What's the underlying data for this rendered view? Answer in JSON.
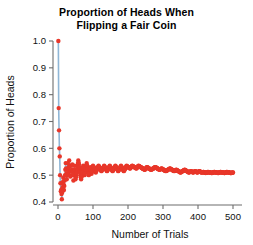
{
  "chart_data": {
    "type": "scatter",
    "title": "Proportion of Heads When\nFlipping a Fair Coin",
    "title_line1": "Proportion of Heads When",
    "title_line2": "Flipping a Fair Coin",
    "xlabel": "Number of Trials",
    "ylabel": "Proportion of Heads",
    "xlim": [
      -8,
      515
    ],
    "ylim": [
      0.38,
      1.03
    ],
    "xticks": [
      0,
      100,
      200,
      300,
      400,
      500
    ],
    "xticklabels": [
      "0",
      "100",
      "200",
      "300",
      "400",
      "500"
    ],
    "yticks": [
      0.4,
      0.5,
      0.6,
      0.7,
      0.8,
      0.9,
      1.0
    ],
    "yticklabels": [
      "0.4",
      "0.5",
      "0.6",
      "0.7",
      "0.8",
      "0.9",
      "1.0"
    ],
    "grid": false,
    "legend": null,
    "marker_color": "#e8372a",
    "line_color": "#8fb6d6",
    "axis_color": "#6d6d6d",
    "marker_size": 2.2,
    "series": [
      {
        "name": "Running proportion of heads",
        "x": [
          1,
          2,
          3,
          4,
          5,
          6,
          7,
          8,
          9,
          10,
          11,
          12,
          13,
          14,
          15,
          16,
          17,
          18,
          19,
          20,
          21,
          22,
          23,
          24,
          25,
          26,
          27,
          28,
          29,
          30,
          31,
          32,
          33,
          34,
          35,
          36,
          37,
          38,
          39,
          40,
          41,
          42,
          43,
          44,
          45,
          46,
          47,
          48,
          49,
          50,
          52,
          54,
          56,
          58,
          60,
          62,
          64,
          66,
          68,
          70,
          72,
          74,
          76,
          78,
          80,
          82,
          84,
          86,
          88,
          90,
          92,
          94,
          96,
          98,
          100,
          104,
          108,
          112,
          116,
          120,
          124,
          128,
          132,
          136,
          140,
          144,
          148,
          152,
          156,
          160,
          164,
          168,
          172,
          176,
          180,
          184,
          188,
          192,
          196,
          200,
          206,
          212,
          218,
          224,
          230,
          236,
          242,
          248,
          254,
          260,
          266,
          272,
          278,
          284,
          290,
          296,
          302,
          308,
          314,
          320,
          326,
          332,
          338,
          344,
          350,
          356,
          362,
          368,
          374,
          380,
          386,
          392,
          398,
          404,
          410,
          416,
          422,
          428,
          434,
          440,
          446,
          452,
          458,
          464,
          470,
          476,
          482,
          488,
          494,
          500
        ],
        "y": [
          1.0,
          0.75,
          0.667,
          0.6,
          0.57,
          0.5,
          0.47,
          0.44,
          0.445,
          0.43,
          0.41,
          0.435,
          0.455,
          0.475,
          0.49,
          0.465,
          0.445,
          0.46,
          0.48,
          0.5,
          0.52,
          0.545,
          0.525,
          0.505,
          0.485,
          0.5,
          0.52,
          0.545,
          0.525,
          0.505,
          0.53,
          0.555,
          0.535,
          0.515,
          0.495,
          0.515,
          0.535,
          0.515,
          0.5,
          0.52,
          0.54,
          0.52,
          0.5,
          0.48,
          0.5,
          0.515,
          0.535,
          0.52,
          0.5,
          0.485,
          0.5,
          0.515,
          0.535,
          0.555,
          0.54,
          0.52,
          0.5,
          0.485,
          0.5,
          0.52,
          0.535,
          0.515,
          0.5,
          0.515,
          0.53,
          0.545,
          0.53,
          0.515,
          0.5,
          0.515,
          0.53,
          0.52,
          0.505,
          0.52,
          0.535,
          0.525,
          0.51,
          0.525,
          0.535,
          0.525,
          0.515,
          0.525,
          0.535,
          0.525,
          0.515,
          0.525,
          0.535,
          0.525,
          0.515,
          0.525,
          0.535,
          0.525,
          0.515,
          0.525,
          0.535,
          0.525,
          0.515,
          0.525,
          0.535,
          0.53,
          0.525,
          0.535,
          0.53,
          0.525,
          0.535,
          0.53,
          0.525,
          0.52,
          0.53,
          0.525,
          0.52,
          0.525,
          0.53,
          0.525,
          0.52,
          0.525,
          0.52,
          0.515,
          0.52,
          0.525,
          0.52,
          0.515,
          0.52,
          0.515,
          0.51,
          0.515,
          0.52,
          0.515,
          0.51,
          0.515,
          0.51,
          0.515,
          0.51,
          0.515,
          0.51,
          0.512,
          0.508,
          0.512,
          0.51,
          0.508,
          0.512,
          0.51,
          0.508,
          0.512,
          0.51,
          0.508,
          0.512,
          0.51,
          0.508,
          0.51
        ]
      }
    ],
    "connector_line": {
      "note": "light blue polyline connecting the earliest points",
      "x": [
        1,
        2,
        3,
        4,
        5,
        6,
        7,
        8,
        9,
        10,
        11,
        12,
        13,
        14,
        15,
        16,
        17,
        18,
        19,
        20,
        22,
        25,
        28,
        32,
        36,
        40
      ],
      "y": [
        1.0,
        0.75,
        0.667,
        0.6,
        0.57,
        0.5,
        0.47,
        0.44,
        0.445,
        0.43,
        0.41,
        0.435,
        0.455,
        0.475,
        0.49,
        0.465,
        0.445,
        0.46,
        0.48,
        0.5,
        0.545,
        0.485,
        0.545,
        0.555,
        0.515,
        0.52
      ]
    }
  }
}
